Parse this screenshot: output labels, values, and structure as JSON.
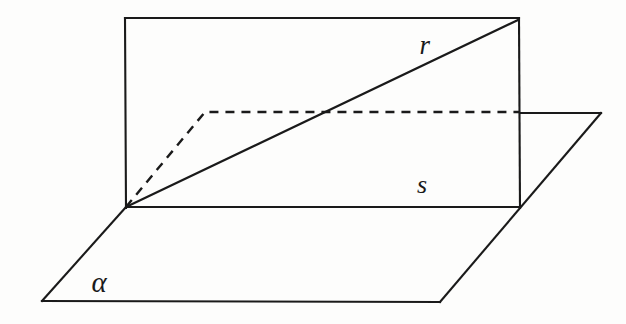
{
  "figure": {
    "kind": "solid-geometry-diagram",
    "background_color": "#fdfdfc",
    "stroke_color": "#1a1a1a"
  },
  "labels": {
    "line_r": "r",
    "line_s": "s",
    "plane_alpha": "α"
  },
  "chart_data": {
    "type": "diagram",
    "title": "",
    "xlabel": "",
    "ylabel": "",
    "grid": false,
    "legend_position": "none",
    "xlim": [
      0,
      626
    ],
    "ylim": [
      0,
      324
    ],
    "annotations": [
      {
        "text": "r",
        "x": 425,
        "y": 45,
        "style": "italic-serif"
      },
      {
        "text": "s",
        "x": 422,
        "y": 185,
        "style": "italic-serif"
      },
      {
        "text": "α",
        "x": 99,
        "y": 282,
        "style": "italic-serif"
      }
    ],
    "points": {
      "vertex": [
        126,
        207
      ],
      "rect_top_left": [
        125,
        18
      ],
      "rect_top_right": [
        519,
        18
      ],
      "rect_bottom_right": [
        520,
        207
      ],
      "plane_left": [
        42,
        301
      ],
      "plane_bottom_right": [
        440,
        302
      ],
      "plane_right": [
        601,
        113
      ],
      "dash_bend": [
        205,
        112
      ],
      "dash_end": [
        520,
        112
      ],
      "r_crossing": [
        322,
        113
      ]
    },
    "series": [
      {
        "name": "rectangle-plane",
        "style": "solid",
        "path": [
          [
            126,
            207
          ],
          [
            125,
            18
          ],
          [
            519,
            18
          ],
          [
            520,
            207
          ],
          [
            126,
            207
          ]
        ]
      },
      {
        "name": "plane-alpha-parallelogram",
        "style": "solid",
        "path": [
          [
            126,
            207
          ],
          [
            42,
            301
          ],
          [
            440,
            302
          ],
          [
            601,
            113
          ],
          [
            520,
            113
          ]
        ]
      },
      {
        "name": "line-r",
        "style": "solid",
        "path": [
          [
            126,
            207
          ],
          [
            519,
            19
          ]
        ]
      },
      {
        "name": "line-s",
        "style": "solid",
        "path": [
          [
            126,
            207
          ],
          [
            520,
            207
          ]
        ]
      },
      {
        "name": "dashed-projection-polyline",
        "style": "dashed",
        "path": [
          [
            126,
            207
          ],
          [
            205,
            112
          ],
          [
            520,
            112
          ]
        ]
      }
    ]
  }
}
